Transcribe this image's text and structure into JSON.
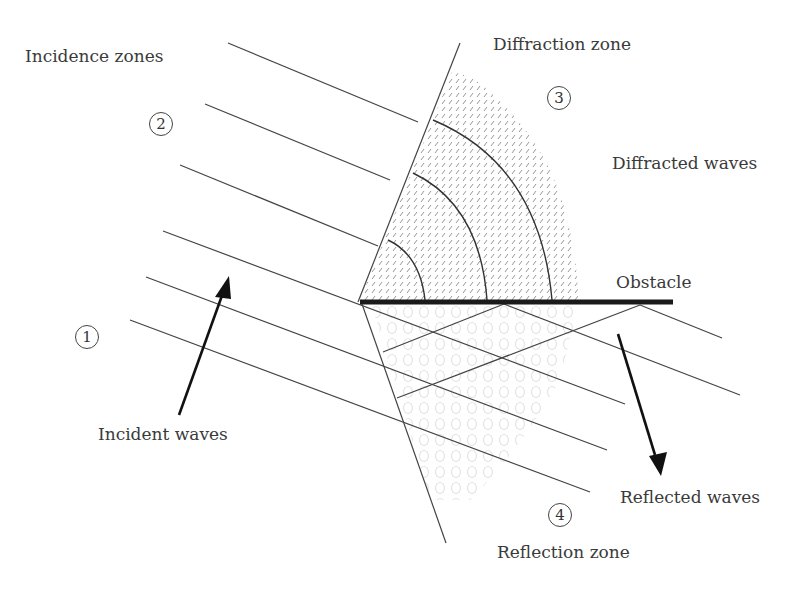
{
  "diagram": {
    "type": "wave-obstacle-interaction",
    "labels": {
      "incidence_zones": "Incidence zones",
      "diffraction_zone": "Diffraction zone",
      "diffracted_waves": "Diffracted waves",
      "obstacle": "Obstacle",
      "incident_waves": "Incident waves",
      "reflected_waves": "Reflected waves",
      "reflection_zone": "Reflection zone"
    },
    "zones": [
      {
        "id": "1",
        "label": "1"
      },
      {
        "id": "2",
        "label": "2"
      },
      {
        "id": "3",
        "label": "3"
      },
      {
        "id": "4",
        "label": "4"
      }
    ],
    "colors": {
      "line": "#444444",
      "obstacle": "#1a1a1a",
      "arrow": "#111111",
      "hatch": "#8a8a8a",
      "reflection_pattern": "#e2e2e2",
      "text": "#3a3a3a"
    }
  }
}
